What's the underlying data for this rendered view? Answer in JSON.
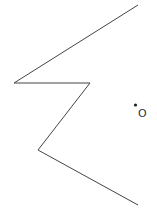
{
  "diagram": {
    "polyline_points": [
      [
        138,
        5
      ],
      [
        14,
        83
      ],
      [
        90,
        83
      ],
      [
        38,
        150
      ],
      [
        138,
        205
      ]
    ],
    "stroke_color": "#444444",
    "point": {
      "x": 135.5,
      "y": 105,
      "label": "O"
    }
  }
}
